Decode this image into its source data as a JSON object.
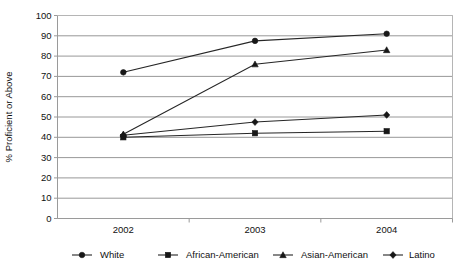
{
  "chart_data": {
    "type": "line",
    "title": "",
    "xlabel": "",
    "ylabel": "% Proficient or Above",
    "categories": [
      "2002",
      "2003",
      "2004"
    ],
    "ylim": [
      0,
      100
    ],
    "ytick_step": 10,
    "ytick_labels": [
      "0",
      "10",
      "20",
      "30",
      "40",
      "50",
      "60",
      "70",
      "80",
      "90",
      "100"
    ],
    "grid": "horizontal",
    "legend_position": "bottom",
    "color": "#171717",
    "series": [
      {
        "name": "White",
        "marker": "circle",
        "values": [
          72,
          87.5,
          91
        ]
      },
      {
        "name": "African-American",
        "marker": "square",
        "values": [
          40,
          42,
          43
        ]
      },
      {
        "name": "Asian-American",
        "marker": "triangle",
        "values": [
          41.5,
          76,
          83
        ]
      },
      {
        "name": "Latino",
        "marker": "diamond",
        "values": [
          41,
          47.5,
          51
        ]
      }
    ]
  }
}
